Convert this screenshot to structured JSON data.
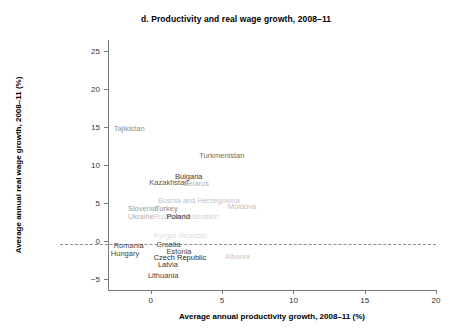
{
  "chart_data": {
    "type": "scatter",
    "title": "d. Productivity and real wage growth, 2008–11",
    "xlabel": "Average annual productivity growth, 2008–11 (%)",
    "ylabel": "Average annual real wage growth, 2008–11 (%)",
    "xlim": [
      -3.0,
      20.0
    ],
    "ylim": [
      -6.5,
      26.5
    ],
    "xticks": [
      "0",
      "5",
      "10",
      "15",
      "20"
    ],
    "xtick_values": [
      0,
      5,
      10,
      15,
      20
    ],
    "yticks": [
      "25",
      "20",
      "15",
      "10",
      "5",
      "0",
      "−5"
    ],
    "ytick_values": [
      25,
      20,
      15,
      10,
      5,
      0,
      -5
    ],
    "grid": false,
    "legend": "none",
    "reference_lines": [
      {
        "axis": "x",
        "value": 0,
        "style": "dashed"
      },
      {
        "axis": "y",
        "value": 0,
        "style": "dashed"
      }
    ],
    "points": [
      {
        "label": "Tajikistan",
        "x": -2.6,
        "y": 14.8,
        "color": "#8f8f8f",
        "anchor": "left"
      },
      {
        "label": "Turkmenistan",
        "x": 3.4,
        "y": 11.2,
        "color": "#6e6e6e",
        "anchor": "left"
      },
      {
        "label": "Bulgaria",
        "x": 1.7,
        "y": 8.4,
        "color": "#3a3a3a",
        "anchor": "left"
      },
      {
        "label": "Kazakhstan",
        "x": -0.1,
        "y": 7.6,
        "color": "#555555",
        "anchor": "left"
      },
      {
        "label": "Belarus",
        "x": 2.3,
        "y": 7.5,
        "color": "#b4b4b4",
        "anchor": "left"
      },
      {
        "label": "Bosnia and Herzegovina",
        "x": 0.5,
        "y": 5.2,
        "color": "#c2c2c2",
        "anchor": "left"
      },
      {
        "label": "Moldova",
        "x": 5.4,
        "y": 4.5,
        "color": "#c0c0c0",
        "anchor": "left"
      },
      {
        "label": "Slovenia",
        "x": -1.6,
        "y": 4.2,
        "color": "#9a9a9a",
        "anchor": "left"
      },
      {
        "label": "Turkey",
        "x": 0.3,
        "y": 4.2,
        "color": "#8a8a8a",
        "anchor": "left"
      },
      {
        "label": "Ukraine",
        "x": -1.6,
        "y": 3.2,
        "color": "#b0b0b0",
        "anchor": "left"
      },
      {
        "label": "Russian Federation",
        "x": 0.2,
        "y": 3.2,
        "color": "#d2d2d2",
        "anchor": "left"
      },
      {
        "label": "Poland",
        "x": 1.1,
        "y": 3.2,
        "color": "#2d2d2d",
        "anchor": "left"
      },
      {
        "label": "Kyrgyz Republic",
        "x": 0.2,
        "y": 0.6,
        "color": "#dcdcdc",
        "anchor": "left"
      },
      {
        "label": "Romania",
        "x": -2.6,
        "y": -0.7,
        "color": "#4a4a4a",
        "anchor": "left"
      },
      {
        "label": "Croatia",
        "x": 0.4,
        "y": -0.6,
        "color": "#3c3c3c",
        "anchor": "left"
      },
      {
        "label": "Estonia",
        "x": 1.1,
        "y": -1.5,
        "color": "#454545",
        "anchor": "left"
      },
      {
        "label": "Hungary",
        "x": -2.8,
        "y": -1.7,
        "color": "#3f3f3f",
        "anchor": "left"
      },
      {
        "label": "Czech Republic",
        "x": 0.2,
        "y": -2.3,
        "color": "#2b2b2b",
        "anchor": "left"
      },
      {
        "label": "Albania",
        "x": 5.2,
        "y": -2.2,
        "color": "#cacaca",
        "anchor": "left"
      },
      {
        "label": "Latvia",
        "x": 0.5,
        "y": -3.2,
        "color": "#3a3a3a",
        "anchor": "left"
      },
      {
        "label": "Lithuania",
        "x": -0.2,
        "y": -4.6,
        "color": "#444444",
        "anchor": "left"
      }
    ]
  }
}
